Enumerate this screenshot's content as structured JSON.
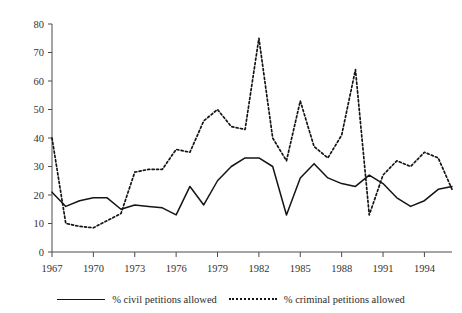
{
  "chart_data": {
    "type": "line",
    "title": "",
    "xlabel": "",
    "ylabel": "",
    "xlim": [
      1967,
      1996
    ],
    "ylim": [
      0,
      80
    ],
    "grid": false,
    "legend_position": "bottom",
    "x": [
      1967,
      1968,
      1969,
      1970,
      1971,
      1972,
      1973,
      1974,
      1975,
      1976,
      1977,
      1978,
      1979,
      1980,
      1981,
      1982,
      1983,
      1984,
      1985,
      1986,
      1987,
      1988,
      1989,
      1990,
      1991,
      1992,
      1993,
      1994,
      1995,
      1996
    ],
    "xticks": [
      1967,
      1970,
      1973,
      1976,
      1979,
      1982,
      1985,
      1988,
      1991,
      1994
    ],
    "xtick_labels": [
      "1967",
      "1970",
      "1973",
      "1976",
      "1979",
      "1982",
      "1985",
      "1988",
      "1991",
      "1994"
    ],
    "yticks": [
      0,
      10,
      20,
      30,
      40,
      50,
      60,
      70,
      80
    ],
    "ytick_labels": [
      "0",
      "10",
      "20",
      "30",
      "40",
      "50",
      "60",
      "70",
      "80"
    ],
    "series": [
      {
        "name": "% civil petitions allowed",
        "style": "solid",
        "color": "#141414",
        "values": [
          21,
          16,
          18,
          19,
          19,
          15,
          16.5,
          16,
          15.5,
          13,
          23,
          16.5,
          25,
          30,
          33,
          33,
          30,
          13,
          26,
          31,
          26,
          24,
          23,
          27,
          24,
          19,
          16,
          18,
          22,
          23
        ]
      },
      {
        "name": "% criminal petitions allowed",
        "style": "dotted",
        "color": "#141414",
        "values": [
          40,
          10,
          9,
          8.5,
          11,
          13.5,
          28,
          29,
          29,
          36,
          35,
          46,
          50,
          44,
          43,
          75,
          40,
          32,
          53,
          37,
          33,
          41,
          64,
          13,
          27,
          32,
          30,
          35,
          33,
          22
        ]
      }
    ]
  },
  "legend": {
    "entries": [
      {
        "label": "% civil petitions allowed",
        "swatch": "solid-line-swatch"
      },
      {
        "label": "% criminal petitions allowed",
        "swatch": "dotted-line-swatch"
      }
    ]
  }
}
